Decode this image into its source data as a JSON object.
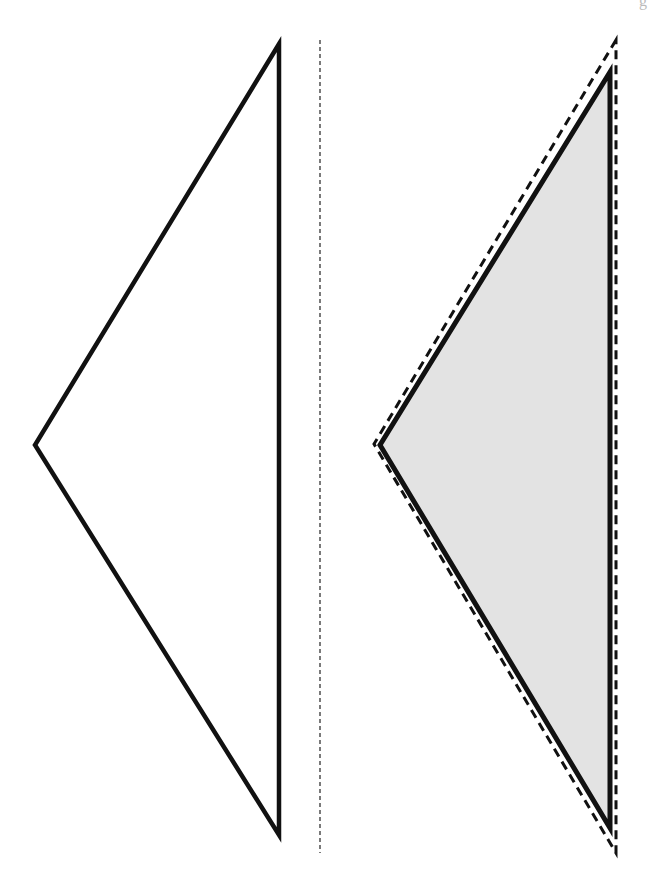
{
  "diagram": {
    "corner_mark": "g",
    "colors": {
      "stroke": "#111111",
      "fill": "#e3e3e3",
      "background": "#ffffff"
    },
    "left_triangle": {
      "points": [
        [
          279,
          44
        ],
        [
          35,
          445
        ],
        [
          279,
          835
        ]
      ],
      "style": "solid outline, no fill"
    },
    "center_line": {
      "x": 320,
      "y1": 40,
      "y2": 853,
      "style": "thin dashed"
    },
    "right_triangle": {
      "points": [
        [
          610,
          72
        ],
        [
          380,
          445
        ],
        [
          610,
          828
        ]
      ],
      "style": "solid outline, gray fill"
    },
    "right_cut_outline": {
      "points": [
        [
          616,
          40
        ],
        [
          374,
          444
        ],
        [
          616,
          853
        ]
      ],
      "style": "thick dashed"
    }
  }
}
